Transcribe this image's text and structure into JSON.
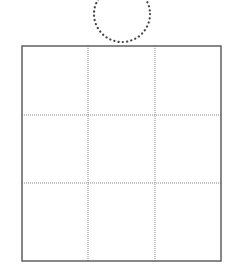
{
  "diagram": {
    "colors": {
      "background": "#ffffff",
      "grid_border": "#555555",
      "grid_dotted": "#8a8a8a",
      "circle_dots": "#444444"
    },
    "circle": {
      "cx": 122,
      "cy": 14,
      "r": 28,
      "style": "dotted"
    },
    "grid": {
      "x": 22,
      "y": 46,
      "width": 199,
      "height": 215,
      "rows": 3,
      "cols": 3,
      "col_lines_x": [
        88,
        155
      ],
      "row_lines_y": [
        115,
        183
      ],
      "inner_style": "dotted",
      "border_style": "solid"
    }
  }
}
